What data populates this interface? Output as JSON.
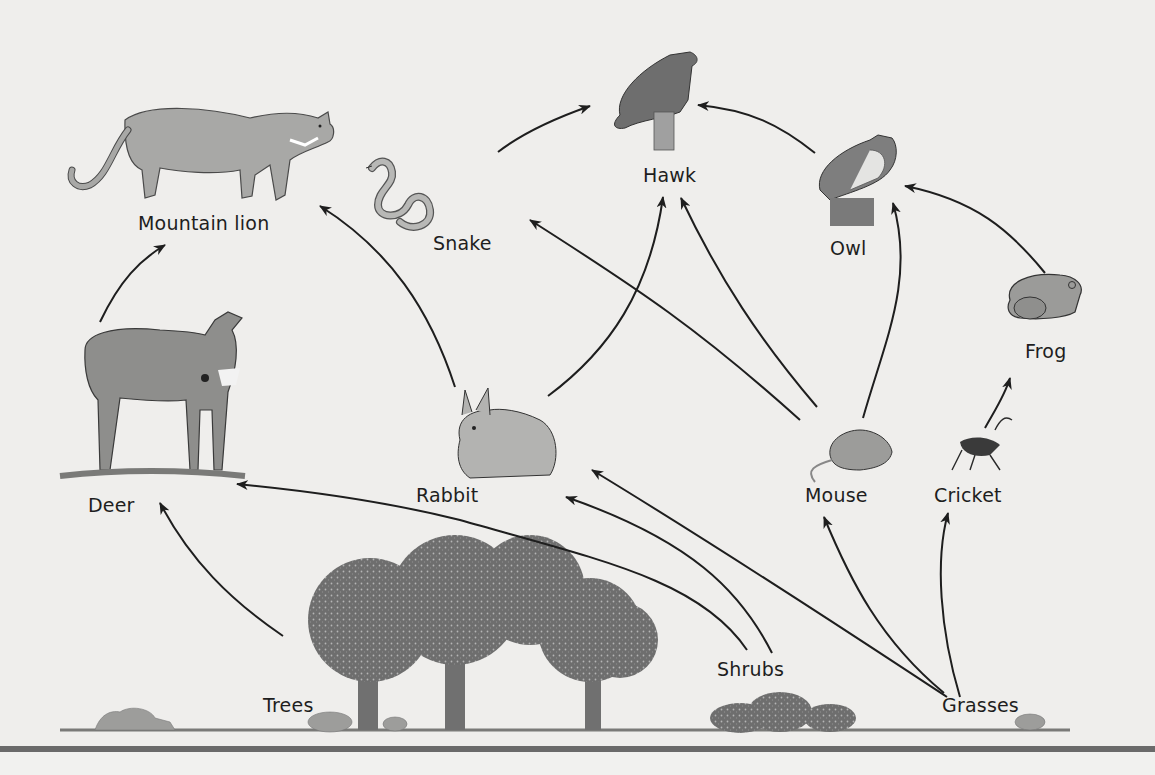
{
  "diagram": {
    "type": "food_web",
    "organisms": {
      "mountain_lion": {
        "label": "Mountain lion",
        "role": "tertiary consumer"
      },
      "hawk": {
        "label": "Hawk",
        "role": "tertiary consumer"
      },
      "owl": {
        "label": "Owl",
        "role": "tertiary consumer"
      },
      "snake": {
        "label": "Snake",
        "role": "secondary consumer"
      },
      "frog": {
        "label": "Frog",
        "role": "secondary consumer"
      },
      "deer": {
        "label": "Deer",
        "role": "primary consumer"
      },
      "rabbit": {
        "label": "Rabbit",
        "role": "primary consumer"
      },
      "mouse": {
        "label": "Mouse",
        "role": "primary consumer"
      },
      "cricket": {
        "label": "Cricket",
        "role": "primary consumer"
      },
      "trees": {
        "label": "Trees",
        "role": "producer"
      },
      "shrubs": {
        "label": "Shrubs",
        "role": "producer"
      },
      "grasses": {
        "label": "Grasses",
        "role": "producer"
      }
    },
    "arrows": [
      {
        "from": "Deer",
        "to": "Mountain lion"
      },
      {
        "from": "Rabbit",
        "to": "Mountain lion"
      },
      {
        "from": "Snake",
        "to": "Hawk"
      },
      {
        "from": "Rabbit",
        "to": "Hawk"
      },
      {
        "from": "Mouse",
        "to": "Hawk"
      },
      {
        "from": "Mouse",
        "to": "Snake"
      },
      {
        "from": "Mouse",
        "to": "Owl"
      },
      {
        "from": "Frog",
        "to": "Hawk"
      },
      {
        "from": "Frog",
        "to": "Owl"
      },
      {
        "from": "Cricket",
        "to": "Frog"
      },
      {
        "from": "Trees",
        "to": "Deer"
      },
      {
        "from": "Shrubs",
        "to": "Deer"
      },
      {
        "from": "Shrubs",
        "to": "Rabbit"
      },
      {
        "from": "Grasses",
        "to": "Rabbit"
      },
      {
        "from": "Grasses",
        "to": "Mouse"
      },
      {
        "from": "Grasses",
        "to": "Cricket"
      }
    ],
    "colors": {
      "background": "#efeeec",
      "ink": "#1e1e1e",
      "organism_fill": "#9a9a9a",
      "foliage": "#6f6f6f",
      "bar": "#6a6a6a"
    }
  }
}
